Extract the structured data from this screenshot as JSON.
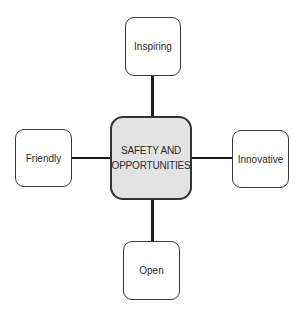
{
  "diagram": {
    "center": {
      "label": "SAFETY AND OPPORTUNITIES",
      "line1": "SAFETY AND",
      "line2": "OPPORTUNITIES",
      "fill": "#e3e3e3"
    },
    "nodes": {
      "top": {
        "label": "Inspiring"
      },
      "left": {
        "label": "Friendly"
      },
      "right": {
        "label": "Innovative"
      },
      "bottom": {
        "label": "Open"
      }
    }
  }
}
